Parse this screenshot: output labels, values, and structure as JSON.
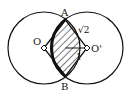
{
  "diagram": {
    "labels": {
      "A": "A",
      "B": "B",
      "O": "O",
      "O_prime": "O'",
      "side_length": "√2",
      "half_diagonal": "1"
    },
    "colors": {
      "stroke": "#111111",
      "background": "#ffffff"
    }
  }
}
